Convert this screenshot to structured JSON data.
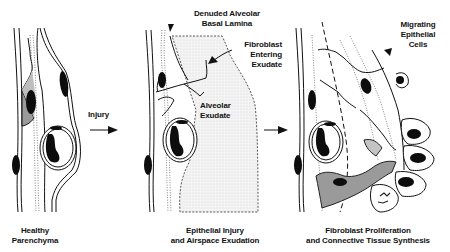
{
  "panels": [
    {
      "id": "healthy",
      "caption_lines": [
        "Healthy",
        "Parenchyma"
      ]
    },
    {
      "id": "injury",
      "caption_lines": [
        "Epithelial Injury",
        "and Airspace Exudation"
      ],
      "annotations": {
        "basal_lamina": [
          "Denuded Alveolar",
          "Basal Lamina"
        ],
        "fibroblast": [
          "Fibroblast",
          "Entering",
          "Exudate"
        ],
        "exudate": [
          "Alveolar",
          "Exudate"
        ]
      }
    },
    {
      "id": "repair",
      "caption_lines": [
        "Fibroblast Proliferation",
        "and Connective Tissue Synthesis"
      ],
      "annotations": {
        "migrating": [
          "Migrating",
          "Epithelial",
          "Cells"
        ]
      }
    }
  ],
  "transitions": {
    "first_label": "Injury",
    "first_arrow": "arrow-right-icon",
    "second_arrow": "arrow-right-icon"
  },
  "colors": {
    "ink": "#111111",
    "nucleus": "#0d0d0d",
    "shading": "#9a9a9a",
    "exudate": "#ececec",
    "background": "#ffffff"
  }
}
